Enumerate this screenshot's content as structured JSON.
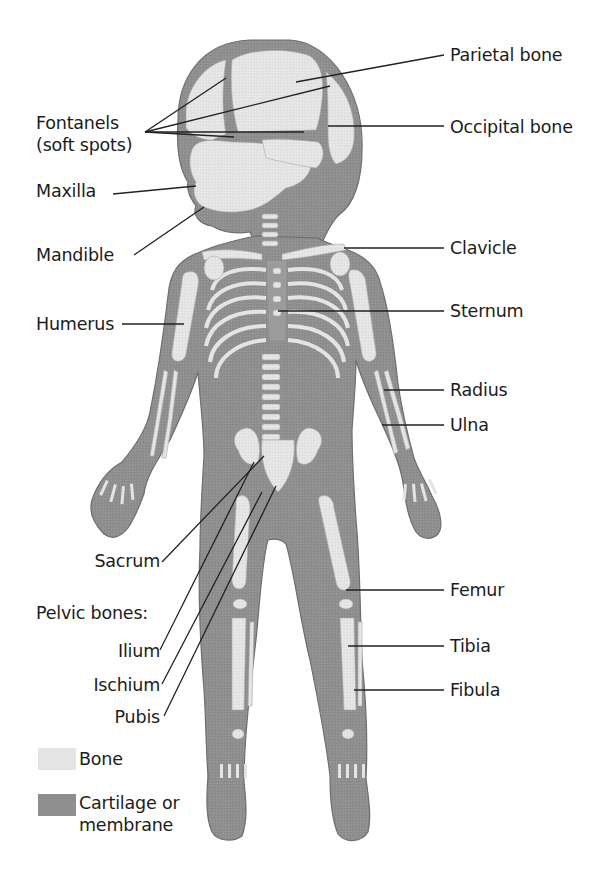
{
  "diagram": {
    "colors": {
      "bone": "#e4e4e4",
      "cartilage": "#8f8f8f",
      "outline": "#6e6e6e",
      "leader_line": "#222222",
      "text": "#1c1c1c",
      "background": "#ffffff"
    },
    "labels_left": [
      {
        "id": "fontanels",
        "text": "Fontanels"
      },
      {
        "id": "fontanels2",
        "text": "(soft spots)"
      },
      {
        "id": "maxilla",
        "text": "Maxilla"
      },
      {
        "id": "mandible",
        "text": "Mandible"
      },
      {
        "id": "humerus",
        "text": "Humerus"
      },
      {
        "id": "sacrum",
        "text": "Sacrum"
      },
      {
        "id": "pelvic",
        "text": "Pelvic bones:"
      },
      {
        "id": "ilium",
        "text": "Ilium"
      },
      {
        "id": "ischium",
        "text": "Ischium"
      },
      {
        "id": "pubis",
        "text": "Pubis"
      }
    ],
    "labels_right": [
      {
        "id": "parietal",
        "text": "Parietal bone"
      },
      {
        "id": "occipital",
        "text": "Occipital bone"
      },
      {
        "id": "clavicle",
        "text": "Clavicle"
      },
      {
        "id": "sternum",
        "text": "Sternum"
      },
      {
        "id": "radius",
        "text": "Radius"
      },
      {
        "id": "ulna",
        "text": "Ulna"
      },
      {
        "id": "femur",
        "text": "Femur"
      },
      {
        "id": "tibia",
        "text": "Tibia"
      },
      {
        "id": "fibula",
        "text": "Fibula"
      }
    ],
    "legend": [
      {
        "key": "bone",
        "label": "Bone"
      },
      {
        "key": "cartilage",
        "label": "Cartilage or"
      },
      {
        "key": "cartilage2",
        "label": "membrane"
      }
    ]
  }
}
